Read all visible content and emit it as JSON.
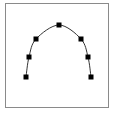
{
  "figure": {
    "type": "arc-with-control-points",
    "frame_color": "#8a8a8a",
    "curve_color": "#333333",
    "point_color": "#000000",
    "points": [
      {
        "x": 26,
        "y": 77
      },
      {
        "x": 29,
        "y": 57
      },
      {
        "x": 36,
        "y": 39
      },
      {
        "x": 59,
        "y": 25
      },
      {
        "x": 81,
        "y": 39
      },
      {
        "x": 88,
        "y": 57
      },
      {
        "x": 91,
        "y": 77
      }
    ]
  }
}
